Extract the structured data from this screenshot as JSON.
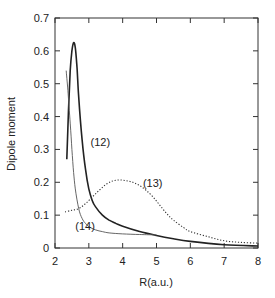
{
  "chart_data": {
    "type": "line",
    "title": "",
    "xlabel": "R(a.u.)",
    "ylabel": "Dipole moment",
    "xlim": [
      2,
      8
    ],
    "ylim": [
      0,
      0.7
    ],
    "xticks": [
      2,
      3,
      4,
      5,
      6,
      7,
      8
    ],
    "yticks": [
      0,
      0.1,
      0.2,
      0.3,
      0.4,
      0.5,
      0.6,
      0.7
    ],
    "xtick_labels": [
      "2",
      "3",
      "4",
      "5",
      "6",
      "7",
      "8"
    ],
    "ytick_labels": [
      "0",
      "0.1",
      "0.2",
      "0.3",
      "0.4",
      "0.5",
      "0.6",
      "0.7"
    ],
    "grid": false,
    "legend": null,
    "series": [
      {
        "name": "(12)",
        "style": "solid-thick",
        "x": [
          2.35,
          2.4,
          2.45,
          2.5,
          2.55,
          2.6,
          2.65,
          2.7,
          2.8,
          2.9,
          3.0,
          3.1,
          3.2,
          3.4,
          3.6,
          3.8,
          4.0,
          4.5,
          5.0,
          5.5,
          6.0,
          7.0,
          8.0
        ],
        "y": [
          0.27,
          0.42,
          0.54,
          0.6,
          0.625,
          0.61,
          0.55,
          0.46,
          0.33,
          0.24,
          0.18,
          0.145,
          0.125,
          0.1,
          0.085,
          0.075,
          0.066,
          0.05,
          0.038,
          0.028,
          0.02,
          0.01,
          0.006
        ]
      },
      {
        "name": "(13)",
        "style": "dotted",
        "x": [
          2.3,
          2.5,
          2.7,
          2.9,
          3.1,
          3.3,
          3.5,
          3.7,
          3.9,
          4.1,
          4.3,
          4.5,
          4.7,
          4.9,
          5.1,
          5.3,
          5.5,
          5.8,
          6.0,
          6.5,
          7.0,
          7.5,
          8.0
        ],
        "y": [
          0.11,
          0.115,
          0.12,
          0.135,
          0.155,
          0.175,
          0.193,
          0.204,
          0.207,
          0.205,
          0.2,
          0.19,
          0.175,
          0.155,
          0.13,
          0.105,
          0.085,
          0.062,
          0.05,
          0.035,
          0.022,
          0.017,
          0.015
        ]
      },
      {
        "name": "(14)",
        "style": "solid-thin",
        "x": [
          2.33,
          2.38,
          2.45,
          2.5,
          2.55,
          2.6,
          2.7,
          2.8,
          2.9,
          3.0,
          3.2,
          3.4,
          3.6,
          4.0,
          4.5,
          5.0
        ],
        "y": [
          0.54,
          0.48,
          0.38,
          0.3,
          0.23,
          0.18,
          0.12,
          0.09,
          0.075,
          0.065,
          0.055,
          0.05,
          0.046,
          0.043,
          0.041,
          0.04
        ]
      }
    ],
    "annotations": [
      {
        "text": "(12)",
        "x": 3.05,
        "y": 0.31
      },
      {
        "text": "(13)",
        "x": 4.6,
        "y": 0.185
      },
      {
        "text": "(14)",
        "x": 2.6,
        "y": 0.055
      }
    ]
  }
}
